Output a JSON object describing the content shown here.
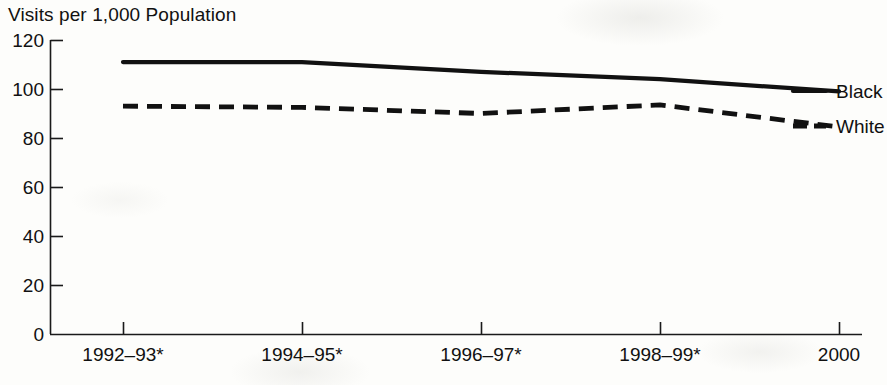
{
  "chart_data": {
    "type": "line",
    "title": "Visits per 1,000 Population",
    "xlabel": "",
    "ylabel": "Visits per 1,000 Population",
    "categories": [
      "1992–93*",
      "1994–95*",
      "1996–97*",
      "1998–99*",
      "2000"
    ],
    "series": [
      {
        "name": "Black",
        "style": "solid",
        "color": "#111111",
        "values": [
          111,
          111,
          107,
          104,
          99
        ]
      },
      {
        "name": "White",
        "style": "dashed",
        "color": "#111111",
        "values": [
          93,
          92.5,
          90,
          93.5,
          84.5
        ]
      }
    ],
    "ylim": [
      0,
      120
    ],
    "yticks": [
      0,
      20,
      40,
      60,
      80,
      100,
      120
    ],
    "ytick_labels": [
      "0",
      "20",
      "40",
      "60",
      "80",
      "100",
      "120"
    ],
    "grid": false,
    "legend_position": "right-inline",
    "footnote_marker": "*"
  },
  "axes": {
    "y_title": "Visits per 1,000 Population"
  },
  "legend": {
    "entries": [
      {
        "label": "Black",
        "style": "solid"
      },
      {
        "label": "White",
        "style": "dashed"
      }
    ]
  }
}
